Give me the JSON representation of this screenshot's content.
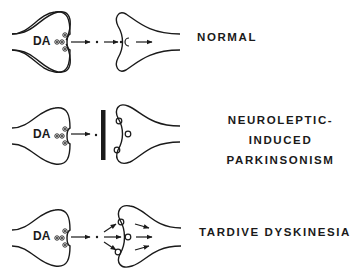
{
  "colors": {
    "ink": "#1a1a1a",
    "background": "#ffffff"
  },
  "rows": [
    {
      "id": "normal",
      "presynaptic_label": "DA",
      "title_lines": [
        "NORMAL"
      ]
    },
    {
      "id": "parkinsonism",
      "presynaptic_label": "DA",
      "title_lines": [
        "NEUROLEPTIC-INDUCED",
        "PARKINSONISM"
      ]
    },
    {
      "id": "tardive",
      "presynaptic_label": "DA",
      "title_lines": [
        "TARDIVE DYSKINESIA"
      ]
    }
  ]
}
